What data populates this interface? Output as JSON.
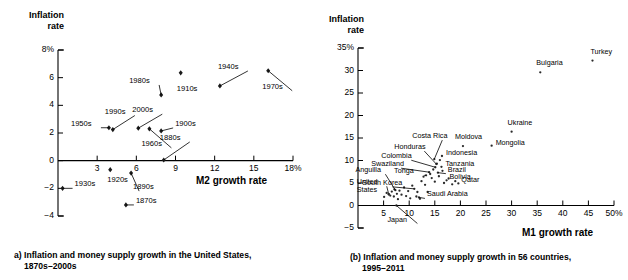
{
  "figure": {
    "panel_a": {
      "caption_line1": "a) Inflation and money supply growth in the United States,",
      "caption_line2": "1870s–2000s"
    },
    "panel_b": {
      "caption_line1": "(b) Inflation and money supply growth in 56 countries,",
      "caption_line2": "1995–2011"
    }
  },
  "chart_data": [
    {
      "id": "panel-a",
      "type": "scatter",
      "title": "a) Inflation and money supply growth in the United States, 1870s–2000s",
      "xlabel": "M2 growth rate",
      "ylabel_line1": "Inflation",
      "ylabel_line2": "rate",
      "xlim": [
        0,
        18
      ],
      "ylim": [
        -4,
        8
      ],
      "xticks": [
        3,
        6,
        9,
        12,
        15,
        18
      ],
      "xticklabels": [
        "3",
        "6",
        "9",
        "12",
        "15",
        "18%"
      ],
      "yticks": [
        -4,
        -2,
        0,
        2,
        4,
        6,
        8
      ],
      "yticklabels": [
        "−4",
        "−2",
        "0",
        "2",
        "4",
        "6",
        "8%"
      ],
      "grid": false,
      "legend": "none",
      "points": [
        {
          "label": "1870s",
          "x": 5.2,
          "y": -3.2,
          "label_dx": 10,
          "label_dy": -4,
          "leader": true
        },
        {
          "label": "1880s",
          "x": 8.1,
          "y": 0.05,
          "label_dx": -4,
          "label_dy": -22,
          "leader": true
        },
        {
          "label": "1890s",
          "x": 5.6,
          "y": -0.9,
          "label_dx": 2,
          "label_dy": 14,
          "leader": true
        },
        {
          "label": "1900s",
          "x": 7.9,
          "y": 2.15,
          "label_dx": 14,
          "label_dy": -7,
          "leader": true
        },
        {
          "label": "1910s",
          "x": 9.4,
          "y": 6.35,
          "label_dx": -4,
          "label_dy": 16,
          "leader": false
        },
        {
          "label": "1920s",
          "x": 4.0,
          "y": -0.65,
          "label_dx": -3,
          "label_dy": 10,
          "leader": false
        },
        {
          "label": "1930s",
          "x": 0.35,
          "y": -2.0,
          "label_dx": 12,
          "label_dy": -4,
          "leader": true
        },
        {
          "label": "1940s",
          "x": 12.4,
          "y": 5.4,
          "label_dx": -2,
          "label_dy": -19,
          "leader": true
        },
        {
          "label": "1950s",
          "x": 3.9,
          "y": 2.38,
          "label_dx": -38,
          "label_dy": -4,
          "leader": true
        },
        {
          "label": "1960s",
          "x": 7.0,
          "y": 2.3,
          "label_dx": -8,
          "label_dy": 15,
          "leader": true
        },
        {
          "label": "1970s",
          "x": 16.1,
          "y": 6.5,
          "label_dx": -6,
          "label_dy": 16,
          "leader": true
        },
        {
          "label": "1980s",
          "x": 7.9,
          "y": 4.75,
          "label_dx": -32,
          "label_dy": -14,
          "leader": true
        },
        {
          "label": "1990s",
          "x": 4.2,
          "y": 2.25,
          "label_dx": -8,
          "label_dy": -18,
          "leader": true
        },
        {
          "label": "2000s",
          "x": 6.15,
          "y": 2.35,
          "label_dx": -6,
          "label_dy": -18,
          "leader": true
        }
      ]
    },
    {
      "id": "panel-b",
      "type": "scatter",
      "title": "(b) Inflation and money supply growth in 56 countries, 1995–2011",
      "xlabel": "M1 growth rate",
      "ylabel_line1": "Inflation",
      "ylabel_line2": "rate",
      "xlim": [
        0,
        50
      ],
      "ylim": [
        -5,
        35
      ],
      "xticks": [
        5,
        10,
        15,
        20,
        25,
        30,
        35,
        40,
        45,
        50
      ],
      "xticklabels": [
        "5",
        "10",
        "15",
        "20",
        "25",
        "30",
        "35",
        "40",
        "45",
        "50%"
      ],
      "yticks": [
        -5,
        0,
        5,
        10,
        15,
        20,
        25,
        30,
        35
      ],
      "yticklabels": [
        "−5",
        "0",
        "5",
        "10",
        "15",
        "20",
        "25",
        "30",
        "35%"
      ],
      "grid": false,
      "legend": "none",
      "labeled_points": [
        {
          "label": "Turkey",
          "x": 45.8,
          "y": 32.2,
          "label_dx": -2,
          "label_dy": -9,
          "leader": false
        },
        {
          "label": "Bulgaria",
          "x": 35.6,
          "y": 29.6,
          "label_dx": -4,
          "label_dy": -9,
          "leader": false
        },
        {
          "label": "Ukraine",
          "x": 30.0,
          "y": 16.4,
          "label_dx": -4,
          "label_dy": -9,
          "leader": false
        },
        {
          "label": "Mongolia",
          "x": 26.1,
          "y": 13.3,
          "label_dx": 4,
          "label_dy": -3,
          "leader": false
        },
        {
          "label": "Moldova",
          "x": 20.5,
          "y": 13.2,
          "label_dx": -8,
          "label_dy": -9,
          "leader": false
        },
        {
          "label": "Costa Rica",
          "x": 14.9,
          "y": 10.3,
          "label_dx": -22,
          "label_dy": -23,
          "leader": true
        },
        {
          "label": "Honduras",
          "x": 15.3,
          "y": 9.2,
          "label_dx": -42,
          "label_dy": -17,
          "leader": true
        },
        {
          "label": "Indonesia",
          "x": 16.4,
          "y": 11.0,
          "label_dx": 4,
          "label_dy": -3,
          "leader": false
        },
        {
          "label": "Colombia",
          "x": 15.1,
          "y": 8.5,
          "label_dx": -54,
          "label_dy": -11,
          "leader": true
        },
        {
          "label": "Tanzania",
          "x": 16.3,
          "y": 8.6,
          "label_dx": 4,
          "label_dy": -3,
          "leader": false
        },
        {
          "label": "Swaziland",
          "x": 13.9,
          "y": 7.4,
          "label_dx": -58,
          "label_dy": -8,
          "leader": true
        },
        {
          "label": "Brazil",
          "x": 15.6,
          "y": 7.3,
          "label_dx": 10,
          "label_dy": -3,
          "leader": true
        },
        {
          "label": "Tonga",
          "x": 13.3,
          "y": 6.7,
          "label_dx": -32,
          "label_dy": -4,
          "leader": true
        },
        {
          "label": "Bolivia",
          "x": 17.3,
          "y": 5.6,
          "label_dx": 3,
          "label_dy": -3,
          "leader": false
        },
        {
          "label": "Qatar",
          "x": 19.6,
          "y": 4.9,
          "label_dx": 3,
          "label_dy": -3,
          "leader": false
        },
        {
          "label": "Anguilla",
          "x": 7.3,
          "y": 3.4,
          "label_dx": -40,
          "label_dy": -20,
          "leader": true
        },
        {
          "label": "South Korea",
          "x": 11.0,
          "y": 3.7,
          "label_dx": -52,
          "label_dy": -6,
          "leader": true
        },
        {
          "label": "United",
          "x": 6.0,
          "y": 2.5,
          "label_dx": -32,
          "label_dy": -12,
          "leader": true
        },
        {
          "label": "States",
          "x": 6.0,
          "y": 2.5,
          "label_dx": -32,
          "label_dy": -4,
          "leader": false
        },
        {
          "label": "Saudi Arabia",
          "x": 11.9,
          "y": 1.8,
          "label_dx": 8,
          "label_dy": -3,
          "leader": true
        },
        {
          "label": "Japan",
          "x": 7.5,
          "y": 0.0,
          "label_dx": -9,
          "label_dy": 14,
          "leader": true
        }
      ],
      "unlabeled_points": [
        {
          "x": 5.1,
          "y": 1.9
        },
        {
          "x": 5.6,
          "y": 2.8
        },
        {
          "x": 6.3,
          "y": 2.2
        },
        {
          "x": 6.6,
          "y": 3.1
        },
        {
          "x": 7.0,
          "y": 2.0
        },
        {
          "x": 7.1,
          "y": 3.6
        },
        {
          "x": 7.6,
          "y": 2.6
        },
        {
          "x": 7.8,
          "y": 1.4
        },
        {
          "x": 8.1,
          "y": 3.3
        },
        {
          "x": 8.5,
          "y": 2.4
        },
        {
          "x": 9.0,
          "y": 4.0
        },
        {
          "x": 9.4,
          "y": 2.1
        },
        {
          "x": 9.8,
          "y": 3.2
        },
        {
          "x": 10.2,
          "y": 1.6
        },
        {
          "x": 10.6,
          "y": 4.4
        },
        {
          "x": 11.4,
          "y": 2.0
        },
        {
          "x": 11.6,
          "y": 3.0
        },
        {
          "x": 12.1,
          "y": 1.5
        },
        {
          "x": 12.4,
          "y": 5.4
        },
        {
          "x": 12.8,
          "y": 6.4
        },
        {
          "x": 13.1,
          "y": 4.6
        },
        {
          "x": 13.6,
          "y": 3.0
        },
        {
          "x": 14.1,
          "y": 7.0
        },
        {
          "x": 14.4,
          "y": 6.1
        },
        {
          "x": 14.7,
          "y": 8.0
        },
        {
          "x": 15.0,
          "y": 5.3
        },
        {
          "x": 15.4,
          "y": 9.3
        },
        {
          "x": 15.8,
          "y": 6.5
        },
        {
          "x": 16.0,
          "y": 10.1
        },
        {
          "x": 16.5,
          "y": 7.7
        },
        {
          "x": 16.8,
          "y": 5.0
        },
        {
          "x": 17.7,
          "y": 6.0
        },
        {
          "x": 18.4,
          "y": 4.7
        },
        {
          "x": 19.0,
          "y": 5.4
        }
      ]
    }
  ]
}
